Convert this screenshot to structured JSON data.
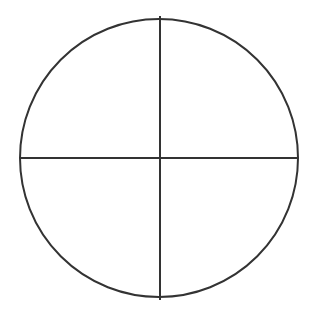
{
  "diagram": {
    "type": "circle-divided-into-quadrants",
    "background": "#ffffff",
    "stroke_color": "#333333",
    "stroke_width": 2,
    "circle": {
      "cx": 159,
      "cy": 158,
      "r": 139
    },
    "vertical_line": {
      "x": 160,
      "y1": 16,
      "y2": 300
    },
    "horizontal_line": {
      "y": 158,
      "x1": 20,
      "x2": 298
    },
    "quadrants": 4
  }
}
